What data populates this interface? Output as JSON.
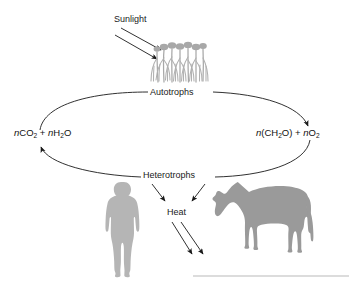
{
  "figure": {
    "background_color": "#ffffff",
    "line_color": "#1a1a1a",
    "plant_color": "#a8a8a8",
    "human_color": "#b5b5b5",
    "cow_color": "#9a9a9a",
    "rule_color": "#b9b9b9"
  },
  "labels": {
    "sunlight": "Sunlight",
    "autotrophs": "Autotrophs",
    "heterotrophs": "Heterotrophs",
    "heat": "Heat"
  },
  "formulas": {
    "left": {
      "full_text": "nCO2 + nH2O",
      "parts": [
        {
          "t": "n",
          "italic": true
        },
        {
          "t": "CO",
          "italic": false
        },
        {
          "t": "2",
          "sub": true
        },
        {
          "t": " + ",
          "italic": false
        },
        {
          "t": "n",
          "italic": true
        },
        {
          "t": "H",
          "italic": false
        },
        {
          "t": "2",
          "sub": true
        },
        {
          "t": "O",
          "italic": false
        }
      ]
    },
    "right": {
      "full_text": "n(CH2O) + nO2",
      "parts": [
        {
          "t": "n",
          "italic": true
        },
        {
          "t": "(CH",
          "italic": false
        },
        {
          "t": "2",
          "sub": true
        },
        {
          "t": "O)",
          "italic": false
        },
        {
          "t": " + ",
          "italic": false
        },
        {
          "t": "n",
          "italic": true
        },
        {
          "t": "O",
          "italic": false
        },
        {
          "t": "2",
          "sub": true
        }
      ]
    }
  },
  "arrows": {
    "sunlight_to_plants_count": 2,
    "heterotrophs_to_heat_count": 2,
    "heat_outgoing_count": 2,
    "cycle_top_direction": "left-to-right",
    "cycle_bottom_direction": "right-to-left"
  },
  "organisms": {
    "plants": "grass-plants",
    "human": "human-silhouette",
    "cow": "grazing-cow-silhouette"
  }
}
